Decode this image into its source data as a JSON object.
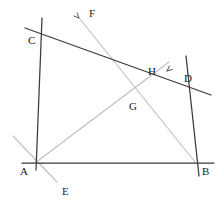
{
  "figure": {
    "background_color": "#ffffff",
    "dark_stroke_color": "#3a3a3a",
    "light_stroke_color": "#bfbfbf",
    "label_color": "#1a1a1a"
  },
  "points": [
    {
      "id": "A",
      "label": "A",
      "x": 35,
      "y": 163,
      "label_x": 20,
      "label_y": 166,
      "kind": "vertex"
    },
    {
      "id": "B",
      "label": "B",
      "x": 196,
      "y": 163,
      "label_x": 202,
      "label_y": 166,
      "kind": "vertex"
    },
    {
      "id": "C",
      "label": "C",
      "x": 41,
      "y": 33,
      "label_x": 28,
      "label_y": 35,
      "kind": "vertex"
    },
    {
      "id": "D",
      "label": "D",
      "x": 189,
      "y": 83,
      "label_x": 184,
      "label_y": 73,
      "kind": "vertex"
    },
    {
      "id": "E",
      "label": "E",
      "x": 58,
      "y": 183,
      "label_x": 62,
      "label_y": 186,
      "kind": "ray-end"
    },
    {
      "id": "F",
      "label": "F",
      "x": 79,
      "y": 18,
      "label_x": 89,
      "label_y": 8,
      "kind": "ray-end"
    },
    {
      "id": "G",
      "label": "G",
      "x": 131,
      "y": 100,
      "label_x": 129,
      "label_y": 101,
      "kind": "intersection"
    },
    {
      "id": "H",
      "label": "H",
      "x": 157,
      "y": 72,
      "label_x": 148,
      "label_y": 66,
      "kind": "intersection"
    }
  ],
  "segments": [
    {
      "name": "baseline-AB",
      "x1": 22,
      "y1": 163,
      "x2": 214,
      "y2": 163,
      "style": "dark"
    },
    {
      "name": "vertical-through-C",
      "x1": 42,
      "y1": 18,
      "x2": 36,
      "y2": 170,
      "style": "dark"
    },
    {
      "name": "line-C-to-D",
      "x1": 25,
      "y1": 28,
      "x2": 211,
      "y2": 95,
      "style": "dark"
    },
    {
      "name": "line-D-to-B",
      "x1": 186,
      "y1": 56,
      "x2": 199,
      "y2": 176,
      "style": "dark"
    },
    {
      "name": "ray-F-to-B",
      "x1": 80,
      "y1": 19,
      "x2": 195,
      "y2": 162,
      "style": "light"
    },
    {
      "name": "ray-A-to-H",
      "x1": 35,
      "y1": 163,
      "x2": 169,
      "y2": 62,
      "style": "light"
    },
    {
      "name": "ray-through-A-to-E",
      "x1": 13,
      "y1": 136,
      "x2": 57,
      "y2": 182,
      "style": "light"
    }
  ],
  "arrowheads": [
    {
      "name": "arrowhead-near-F",
      "x": 79,
      "y": 18,
      "angle_deg": 225
    },
    {
      "name": "arrowhead-near-H",
      "x": 167,
      "y": 71,
      "angle_deg": 320
    }
  ]
}
